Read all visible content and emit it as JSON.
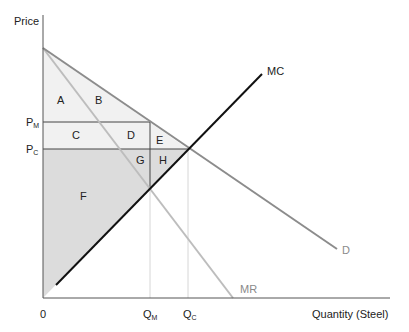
{
  "axes": {
    "y_label": "Price",
    "x_label": "Quantity (Steel)",
    "origin": "0"
  },
  "price_ticks": [
    {
      "main": "P",
      "sub": "M"
    },
    {
      "main": "P",
      "sub": "C"
    }
  ],
  "quantity_ticks": [
    {
      "main": "Q",
      "sub": "M"
    },
    {
      "main": "Q",
      "sub": "C"
    }
  ],
  "curves": {
    "mc": "MC",
    "d": "D",
    "mr": "MR"
  },
  "regions": {
    "a": "A",
    "b": "B",
    "c": "C",
    "d": "D",
    "e": "E",
    "f": "F",
    "g": "G",
    "h": "H"
  },
  "colors": {
    "mc": "#111111",
    "demand": "#8c8c8c",
    "mr": "#bdbdbd",
    "light_fill": "#f1f1f1",
    "dark_fill": "#dcdcdc",
    "axis": "#555555"
  }
}
